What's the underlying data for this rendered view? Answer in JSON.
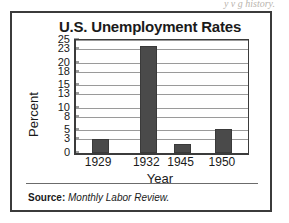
{
  "bleed_text": "y   v        g        history.",
  "figure": {
    "title": "U.S. Unemployment Rates",
    "source_label": "Source:",
    "source_value": "Monthly Labor Review."
  },
  "chart_data": {
    "type": "bar",
    "title": "U.S. Unemployment Rates",
    "xlabel": "Year",
    "ylabel": "Percent",
    "categories": [
      "1929",
      "1932",
      "1945",
      "1950"
    ],
    "values": [
      3.2,
      23.6,
      1.9,
      5.3
    ],
    "ylim": [
      0,
      25
    ],
    "yticks": [
      0,
      3,
      5,
      8,
      10,
      13,
      15,
      18,
      20,
      23,
      25
    ],
    "ytick_labels": [
      "0",
      "3",
      "5",
      "8",
      "10",
      "13",
      "15",
      "18",
      "20",
      "23",
      "25"
    ],
    "grid": true,
    "legend": null,
    "bar_color": "#4a4a4a",
    "axis_color": "#3b3b3b",
    "gridline_color": "#9a9a9a"
  }
}
